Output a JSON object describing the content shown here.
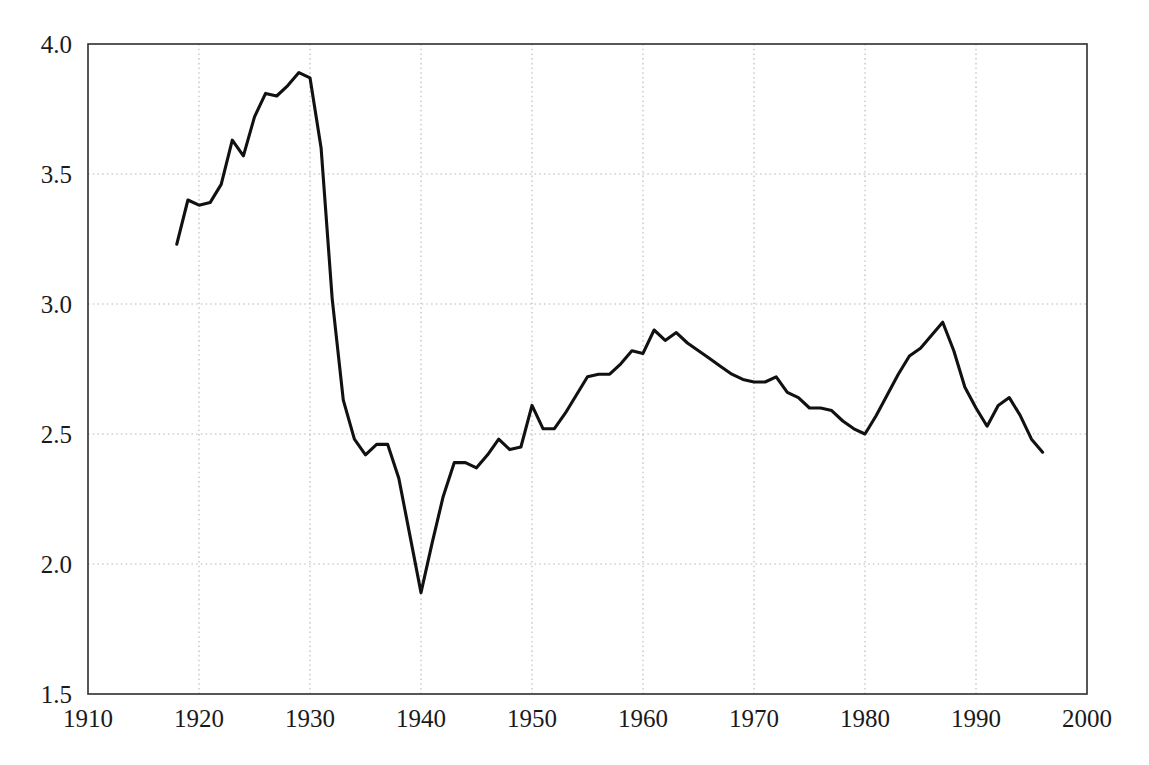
{
  "chart_data": {
    "type": "line",
    "title": "",
    "subtitle": "",
    "xlabel": "",
    "ylabel": "",
    "xlim": [
      1910,
      2000
    ],
    "ylim": [
      1.5,
      4.0
    ],
    "grid": true,
    "legend": null,
    "legend_position": "none",
    "x_ticks": [
      1910,
      1920,
      1930,
      1940,
      1950,
      1960,
      1970,
      1980,
      1990,
      2000
    ],
    "x_tick_labels": [
      "1910",
      "1920",
      "1930",
      "1940",
      "1950",
      "1960",
      "1970",
      "1980",
      "1990",
      "2000"
    ],
    "y_ticks": [
      1.5,
      2.0,
      2.5,
      3.0,
      3.5,
      4.0
    ],
    "y_tick_labels": [
      "1.5",
      "2.0",
      "2.5",
      "3.0",
      "3.5",
      "4.0"
    ],
    "line_color": "#111111",
    "grid_color": "#b9b9b9",
    "frame_color": "#3a3a3a",
    "series": [
      {
        "name": "series-1",
        "x": [
          1918,
          1919,
          1920,
          1921,
          1922,
          1923,
          1924,
          1925,
          1926,
          1927,
          1928,
          1929,
          1930,
          1931,
          1932,
          1933,
          1934,
          1935,
          1936,
          1937,
          1938,
          1939,
          1940,
          1941,
          1942,
          1943,
          1944,
          1945,
          1946,
          1947,
          1948,
          1949,
          1950,
          1951,
          1952,
          1953,
          1954,
          1955,
          1956,
          1957,
          1958,
          1959,
          1960,
          1961,
          1962,
          1963,
          1964,
          1965,
          1966,
          1967,
          1968,
          1969,
          1970,
          1971,
          1972,
          1973,
          1974,
          1975,
          1976,
          1977,
          1978,
          1979,
          1980,
          1981,
          1982,
          1983,
          1984,
          1985,
          1986,
          1987,
          1988,
          1989,
          1990,
          1991,
          1992,
          1993,
          1994,
          1995,
          1996
        ],
        "values": [
          3.23,
          3.4,
          3.38,
          3.39,
          3.46,
          3.63,
          3.57,
          3.72,
          3.81,
          3.8,
          3.84,
          3.89,
          3.87,
          3.6,
          3.02,
          2.63,
          2.48,
          2.42,
          2.46,
          2.46,
          2.33,
          2.11,
          1.89,
          2.08,
          2.26,
          2.39,
          2.39,
          2.37,
          2.42,
          2.48,
          2.44,
          2.45,
          2.61,
          2.52,
          2.52,
          2.58,
          2.65,
          2.72,
          2.73,
          2.73,
          2.77,
          2.82,
          2.81,
          2.9,
          2.86,
          2.89,
          2.85,
          2.82,
          2.79,
          2.76,
          2.73,
          2.71,
          2.7,
          2.7,
          2.72,
          2.66,
          2.64,
          2.6,
          2.6,
          2.59,
          2.55,
          2.52,
          2.5,
          2.57,
          2.65,
          2.73,
          2.8,
          2.83,
          2.88,
          2.93,
          2.82,
          2.68,
          2.6,
          2.53,
          2.61,
          2.64,
          2.57,
          2.48,
          2.43
        ]
      }
    ]
  },
  "axes": {
    "y_labels": [
      "4.0",
      "3.5",
      "3.0",
      "2.5",
      "2.0",
      "1.5"
    ],
    "x_labels": [
      "1910",
      "1920",
      "1930",
      "1940",
      "1950",
      "1960",
      "1970",
      "1980",
      "1990",
      "2000"
    ]
  }
}
